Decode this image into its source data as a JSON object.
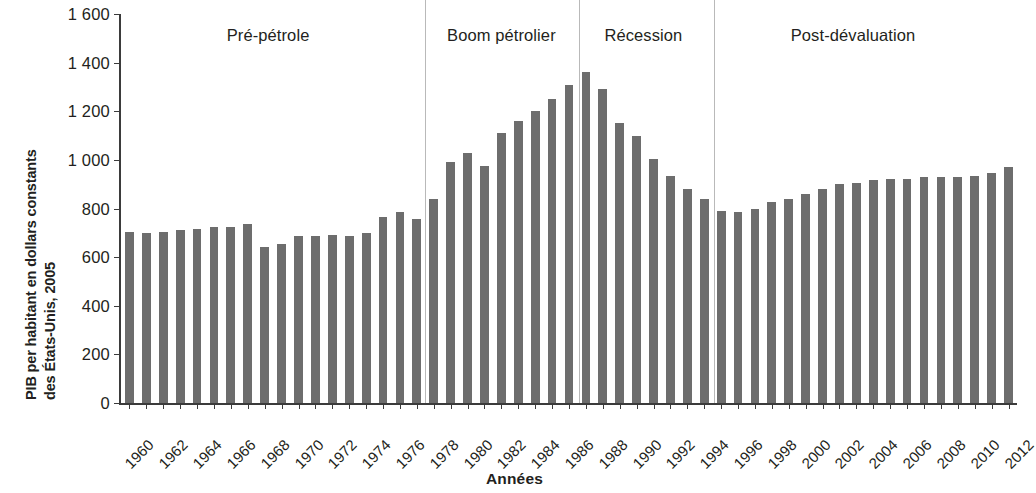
{
  "chart_data": {
    "type": "bar",
    "title": "",
    "xlabel": "Années",
    "ylabel": "PIB per habitant en dollars constants des États-Unis, 2005",
    "ylabel_line1": "PIB per habitant en dollars constants",
    "ylabel_line2": "des États-Unis, 2005",
    "ylim": [
      0,
      1600
    ],
    "ytick_labels": [
      "0",
      "200",
      "400",
      "600",
      "800",
      "1 000",
      "1 200",
      "1 400",
      "1 600"
    ],
    "ytick_values": [
      0,
      200,
      400,
      600,
      800,
      1000,
      1200,
      1400,
      1600
    ],
    "grid": false,
    "legend": "none",
    "bar_color": "#6d6d6d",
    "axis_color": "#3b3b3b",
    "divider_color": "#b9b9b9",
    "xlim": [
      1960,
      2012
    ],
    "xtick_labels": [
      "1960",
      "1962",
      "1964",
      "1966",
      "1968",
      "1970",
      "1972",
      "1974",
      "1976",
      "1978",
      "1980",
      "1982",
      "1984",
      "1986",
      "1988",
      "1990",
      "1992",
      "1994",
      "1996",
      "1998",
      "2000",
      "2002",
      "2004",
      "2006",
      "2008",
      "2010",
      "2012"
    ],
    "categories": [
      1960,
      1961,
      1962,
      1963,
      1964,
      1965,
      1966,
      1967,
      1968,
      1969,
      1970,
      1971,
      1972,
      1973,
      1974,
      1975,
      1976,
      1977,
      1978,
      1979,
      1980,
      1981,
      1982,
      1983,
      1984,
      1985,
      1986,
      1987,
      1988,
      1989,
      1990,
      1991,
      1992,
      1993,
      1994,
      1995,
      1996,
      1997,
      1998,
      1999,
      2000,
      2001,
      2002,
      2003,
      2004,
      2005,
      2006,
      2007,
      2008,
      2009,
      2010,
      2011,
      2012
    ],
    "values": [
      705,
      700,
      705,
      712,
      717,
      725,
      722,
      735,
      640,
      655,
      685,
      688,
      690,
      688,
      700,
      765,
      785,
      755,
      840,
      990,
      1030,
      975,
      1110,
      1160,
      1200,
      1250,
      1310,
      1360,
      1290,
      1150,
      1100,
      1005,
      935,
      880,
      840,
      790,
      785,
      800,
      825,
      840,
      860,
      880,
      900,
      905,
      918,
      920,
      920,
      930,
      930,
      928,
      935,
      945,
      970
    ],
    "annotations": [
      {
        "label": "Pré-pétrole",
        "x_center": 1968.2,
        "period_start": 1960,
        "period_end": 1977
      },
      {
        "label": "Boom pétrolier",
        "x_center": 1982.0,
        "period_start": 1978,
        "period_end": 1986
      },
      {
        "label": "Récession",
        "x_center": 1990.4,
        "period_start": 1987,
        "period_end": 1994
      },
      {
        "label": "Post-dévaluation",
        "x_center": 2002.8,
        "period_start": 1995,
        "period_end": 2012
      }
    ],
    "dividers": [
      1977.5,
      1986.6,
      1994.6
    ]
  }
}
